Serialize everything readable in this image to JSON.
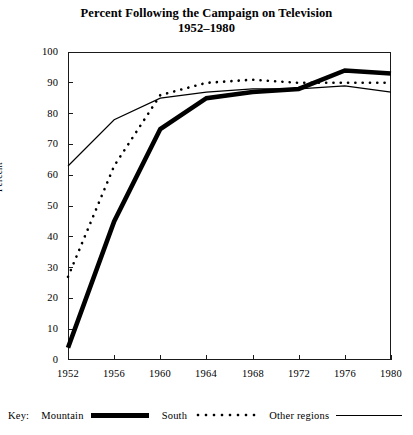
{
  "chart_data": {
    "type": "line",
    "title": "Percent Following the Campaign on Television",
    "subtitle": "1952–1980",
    "xlabel": "",
    "ylabel": "Percent",
    "xlim": [
      1952,
      1980
    ],
    "ylim": [
      0,
      100
    ],
    "grid": false,
    "legend_position": "below-axes",
    "legend_prefix": "Key:",
    "x": [
      1952,
      1956,
      1960,
      1964,
      1968,
      1972,
      1976,
      1980
    ],
    "xticklabels": [
      "1952",
      "1956",
      "1960",
      "1964",
      "1968",
      "1972",
      "1976",
      "1980"
    ],
    "yticks": [
      0,
      10,
      20,
      30,
      40,
      50,
      60,
      70,
      80,
      90,
      100
    ],
    "yticklabels": [
      "0",
      "10",
      "20",
      "30",
      "40",
      "50",
      "60",
      "70",
      "80",
      "90",
      "100"
    ],
    "series": [
      {
        "name": "Mountain",
        "style": "thick-solid",
        "color": "#000000",
        "values": [
          4,
          45,
          75,
          85,
          87,
          88,
          94,
          93
        ]
      },
      {
        "name": "South",
        "style": "dotted",
        "color": "#000000",
        "values": [
          27,
          63,
          86,
          90,
          91,
          90,
          90,
          90
        ]
      },
      {
        "name": "Other regions",
        "style": "thin-solid",
        "color": "#000000",
        "values": [
          63,
          78,
          85,
          87,
          88,
          88,
          89,
          87
        ]
      }
    ]
  },
  "legend": {
    "key_word": "Key:",
    "entries": [
      {
        "label": "Mountain",
        "swatch": "thick-line-swatch"
      },
      {
        "label": "South",
        "swatch": "dotted-line-swatch"
      },
      {
        "label": "Other regions",
        "swatch": "thin-line-swatch"
      }
    ]
  }
}
